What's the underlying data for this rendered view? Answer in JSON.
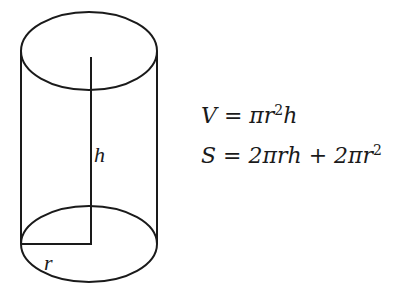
{
  "diagram": {
    "shape": "cylinder",
    "labels": {
      "height": "h",
      "radius": "r"
    },
    "stroke_color": "#1a1a1a"
  },
  "formulas": {
    "volume": {
      "lhs": "V",
      "eq": " = ",
      "rhs_pre": "πr",
      "rhs_exp": "2",
      "rhs_post": "h"
    },
    "surface": {
      "lhs": "S",
      "eq": " = ",
      "rhs_pre": "2πrh + 2πr",
      "rhs_exp": "2"
    }
  }
}
